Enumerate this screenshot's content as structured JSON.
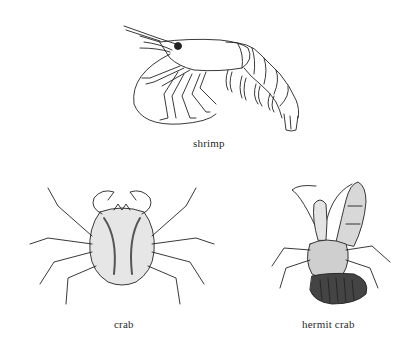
{
  "figures": [
    {
      "id": "shrimp",
      "label": "shrimp",
      "icon": "shrimp-illustration"
    },
    {
      "id": "crab",
      "label": "crab",
      "icon": "crab-illustration"
    },
    {
      "id": "hermit_crab",
      "label": "hermit crab",
      "icon": "hermit-crab-illustration"
    }
  ],
  "colors": {
    "background": "#ffffff",
    "ink": "#222222"
  }
}
